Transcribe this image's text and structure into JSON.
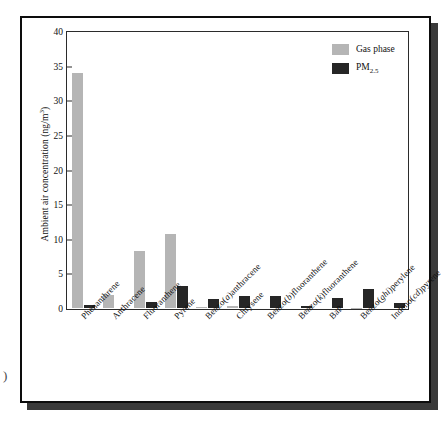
{
  "figure": {
    "margin_glyph": ")"
  },
  "chart_data": {
    "type": "bar",
    "title": "",
    "xlabel": "",
    "ylabel": "Ambient air concentration (ng/m3)",
    "ylabel_unit_base": "Ambient air concentration (ng/m",
    "ylabel_unit_sup": "3",
    "ylabel_unit_tail": ")",
    "ylim": [
      0,
      40
    ],
    "ytick_values": [
      0,
      5,
      10,
      15,
      20,
      25,
      30,
      35,
      40
    ],
    "ytick_labels": [
      "0",
      "5",
      "10",
      "15",
      "20",
      "25",
      "30",
      "35",
      "40"
    ],
    "grid": false,
    "legend_position": "top-right",
    "categories": [
      "Phenanthrene",
      "Anthracene",
      "Fluoranthene",
      "Pyrene",
      "Benzo(a)anthracene",
      "Chrysene",
      "Benzo(b)fluoranthene",
      "Benzo(k)fluoranthene",
      "BaP",
      "Benzo(ghi)perylene",
      "Indeno(cd)pyrene"
    ],
    "categories_parts": [
      {
        "pre": "Phenanthrene",
        "ital": "",
        "post": ""
      },
      {
        "pre": "Anthracene",
        "ital": "",
        "post": ""
      },
      {
        "pre": "Fluoranthene",
        "ital": "",
        "post": ""
      },
      {
        "pre": "Pyrene",
        "ital": "",
        "post": ""
      },
      {
        "pre": "Benzo(",
        "ital": "a",
        "post": ")anthracene"
      },
      {
        "pre": "Chrysene",
        "ital": "",
        "post": ""
      },
      {
        "pre": "Benzo(",
        "ital": "b",
        "post": ")fluoranthene"
      },
      {
        "pre": "Benzo(",
        "ital": "k",
        "post": ")fluoranthene"
      },
      {
        "pre": "BaP",
        "ital": "",
        "post": ""
      },
      {
        "pre": "Benzo(",
        "ital": "ghi",
        "post": ")perylene"
      },
      {
        "pre": "Indeno(",
        "ital": "cd",
        "post": ")pyrene"
      }
    ],
    "series": [
      {
        "name": "Gas phase",
        "color": "#b5b5b5",
        "values": [
          34.0,
          1.9,
          8.3,
          10.7,
          0.15,
          0.35,
          0.0,
          0.0,
          0.0,
          0.05,
          0.0
        ]
      },
      {
        "name": "PM2.5",
        "color": "#262626",
        "name_base": "PM",
        "name_sub": "2.5",
        "values": [
          0.45,
          0.0,
          0.9,
          3.2,
          1.3,
          1.8,
          1.75,
          0.25,
          1.4,
          2.8,
          0.7
        ]
      }
    ]
  },
  "legend": {
    "items": [
      {
        "label": "Gas phase",
        "color": "#b5b5b5"
      },
      {
        "label_base": "PM",
        "label_sub": "2.5",
        "color": "#262626"
      }
    ]
  }
}
